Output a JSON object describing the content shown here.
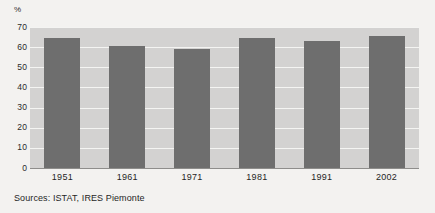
{
  "chart_data": {
    "type": "bar",
    "title": "",
    "subtitle": "",
    "xlabel": "",
    "ylabel": "%",
    "unit_label": "%",
    "categories": [
      "1951",
      "1961",
      "1971",
      "1981",
      "1991",
      "2002"
    ],
    "values": [
      64.5,
      60.5,
      59.0,
      64.5,
      63.0,
      65.5
    ],
    "series": [
      {
        "name": "",
        "values": [
          64.5,
          60.5,
          59.0,
          64.5,
          63.0,
          65.5
        ]
      }
    ],
    "ylim": [
      0,
      70
    ],
    "ytick_values": [
      0,
      10,
      20,
      30,
      40,
      50,
      60,
      70
    ],
    "ytick_labels": [
      "0",
      "10",
      "20",
      "30",
      "40",
      "50",
      "60",
      "70"
    ],
    "grid": true,
    "grid_orientation": "horizontal",
    "legend": false,
    "legend_position": "none",
    "annotations": [],
    "colors": {
      "bar": "#6e6e6e",
      "plot_background": "#d3d2d1",
      "figure_background": "#f3f2f0",
      "gridline": "#f4f4f2",
      "axis": "#8e8d8b",
      "text": "#1f1f1f"
    }
  },
  "footer": {
    "source_note": "Sources: ISTAT, IRES Piemonte"
  }
}
